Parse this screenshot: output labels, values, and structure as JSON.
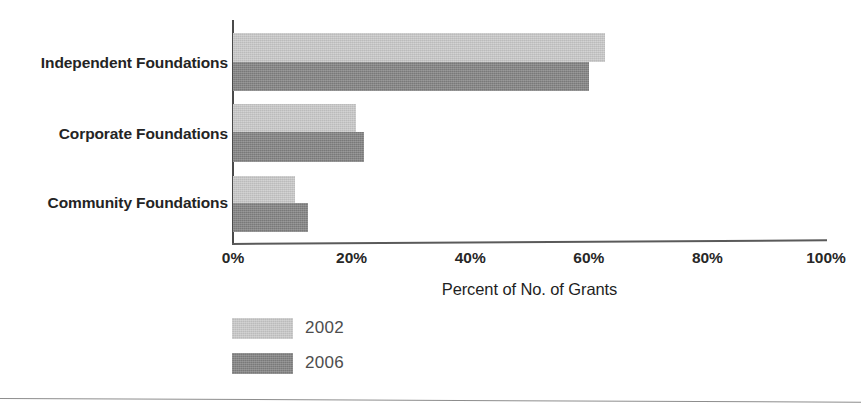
{
  "chart_data": {
    "type": "bar",
    "orientation": "horizontal",
    "title": "",
    "subtitle": "",
    "categories": [
      "Independent Foundations",
      "Corporate Foundations",
      "Community Foundations"
    ],
    "series": [
      {
        "name": "2002",
        "values": [
          62.7,
          20.7,
          10.4
        ],
        "color": "#c9c9c9"
      },
      {
        "name": "2006",
        "values": [
          60.0,
          22.1,
          12.7
        ],
        "color": "#828282"
      }
    ],
    "xlabel": "Percent of No. of Grants",
    "ylabel": "",
    "xlim": [
      0,
      100
    ],
    "xticks": [
      0,
      20,
      40,
      60,
      80,
      100
    ],
    "xticklabels": [
      "0%",
      "20%",
      "40%",
      "60%",
      "80%",
      "100%"
    ],
    "grid": false,
    "legend_position": "bottom-left",
    "legend_entries": [
      "2002",
      "2006"
    ]
  },
  "axis": {
    "x_tick_labels": [
      "0%",
      "20%",
      "40%",
      "60%",
      "80%",
      "100%"
    ],
    "x_title": "Percent of No. of Grants"
  },
  "categories": {
    "c0": "Independent Foundations",
    "c1": "Corporate Foundations",
    "c2": "Community Foundations"
  },
  "legend": {
    "items": [
      {
        "label": "2002"
      },
      {
        "label": "2006"
      }
    ]
  }
}
